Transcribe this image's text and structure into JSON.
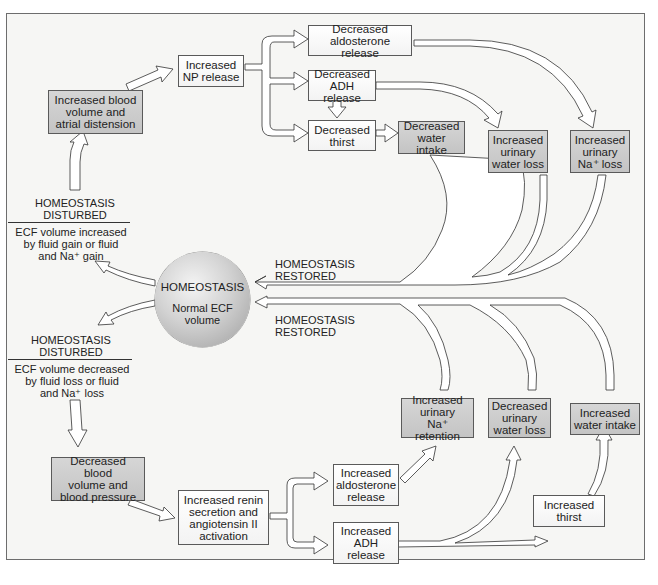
{
  "diagram": {
    "type": "feedback-loop flowchart",
    "topic": "Regulation of extracellular fluid (ECF) volume",
    "colors": {
      "background": "#f6f6f4",
      "frame_border": "#6d6d6d",
      "box_light": "#ffffff",
      "box_gray": "#c8c8c8",
      "arrow_fill": "#ffffff",
      "arrow_stroke": "#333333"
    },
    "center": {
      "title": "HOMEOSTASIS",
      "subtitle": "Normal ECF\nvolume"
    },
    "restored_labels": {
      "upper": "HOMEOSTASIS\nRESTORED",
      "lower": "HOMEOSTASIS\nRESTORED"
    },
    "upper_loop": {
      "disturbed_title": "HOMEOSTASIS\nDISTURBED",
      "disturbed_desc": "ECF volume increased\nby fluid gain or fluid\nand Na⁺ gain",
      "boxes": {
        "blood_volume": "Increased blood\nvolume and\natrial distension",
        "np_release": "Increased\nNP release",
        "aldosterone": "Decreased\naldosterone release",
        "adh": "Decreased\nADH release",
        "thirst": "Decreased\nthirst",
        "water_intake": "Decreased\nwater intake",
        "urinary_water": "Increased\nurinary\nwater loss",
        "urinary_na": "Increased\nurinary\nNa⁺ loss"
      }
    },
    "lower_loop": {
      "disturbed_title": "HOMEOSTASIS\nDISTURBED",
      "disturbed_desc": "ECF volume decreased\nby fluid loss or fluid\nand Na⁺ loss",
      "boxes": {
        "blood_volume": "Decreased blood\nvolume and\nblood pressure",
        "renin": "Increased renin\nsecretion and\nangiotensin II\nactivation",
        "aldosterone": "Increased\naldosterone\nrelease",
        "adh": "Increased\nADH\nrelease",
        "thirst": "Increased\nthirst",
        "na_retention": "Increased\nurinary\nNa⁺ retention",
        "urinary_water": "Decreased\nurinary\nwater loss",
        "water_intake": "Increased\nwater intake"
      }
    }
  }
}
